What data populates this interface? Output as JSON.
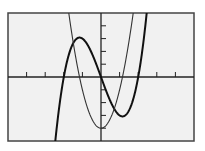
{
  "chart_data": {
    "type": "line",
    "title": "",
    "xlabel": "",
    "ylabel": "",
    "xlim": [
      -5,
      5
    ],
    "ylim": [
      -5,
      5
    ],
    "xtick_step": 1,
    "ytick_step": 1,
    "grid": false,
    "legend": null,
    "series": [
      {
        "name": "cubic",
        "expression": "y = x^3 - 4x",
        "stroke": "#111111",
        "width": 2.0,
        "key_points": {
          "roots": [
            -2,
            0,
            2
          ],
          "local_max": [
            -1.15,
            3.08
          ],
          "local_min": [
            1.15,
            -3.08
          ]
        }
      },
      {
        "name": "parabola",
        "expression": "y = 3x^2 - 4",
        "stroke": "#333333",
        "width": 1.1,
        "key_points": {
          "roots": [
            -1.15,
            1.15
          ],
          "vertex": [
            0,
            -4
          ]
        }
      }
    ]
  },
  "colors": {
    "plot_bg": "#f1f1f1",
    "frame": "#444444",
    "axis": "#222222"
  }
}
